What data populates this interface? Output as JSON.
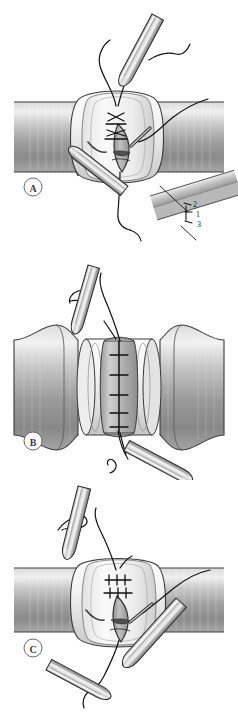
{
  "figure": {
    "background_color": "#ffffff",
    "width": 238,
    "height": 715,
    "panel_count": 3
  },
  "palette": {
    "outline": "#2b2b2b",
    "suture_thread": "#111111",
    "vessel_light": "#f2f2f2",
    "vessel_mid": "#b6b6b6",
    "vessel_dark": "#8a8a8a",
    "vessel_shadow": "#6e6e6e",
    "cuff_light": "#fafafa",
    "cuff_mid": "#d8d8d8",
    "lumen_fill": "#b2b2b2",
    "lumen_dark": "#6f6f6f",
    "instrument_light": "#fdfdfd",
    "instrument_mid": "#c4c4c4",
    "instrument_dark": "#8e8e8e",
    "label_text": "#3a3a3a",
    "inset_text": "#1a1a1a"
  },
  "panels": [
    {
      "id": "a",
      "label": "A",
      "caption_letter": "A",
      "description": "Open anastomosis with posterior corner sutures placed, lumen visible, two instruments and needle with suture thread",
      "label_position": {
        "x": 33,
        "y": 187
      },
      "vessel": {
        "top": 102,
        "bottom": 172,
        "orientation": "horizontal"
      },
      "lumen_state": "open",
      "suture_count": 3,
      "instruments": [
        {
          "name": "needle-holder",
          "position": "upper-right",
          "angle": -62
        },
        {
          "name": "forceps",
          "position": "lower-left",
          "angle": 38
        },
        {
          "name": "needle",
          "position": "center-right",
          "angle": 35
        }
      ],
      "inset": {
        "name": "layer-detail-inset",
        "description": "Magnified cross-section showing suture passing through tissue layers",
        "labels": [
          {
            "text": "2",
            "x": 193,
            "y": 205
          },
          {
            "text": "1",
            "x": 196,
            "y": 215
          },
          {
            "text": "3",
            "x": 197,
            "y": 225
          }
        ]
      }
    },
    {
      "id": "b",
      "label": "B",
      "caption_letter": "B",
      "description": "Completed running anastomosis, closed suture line with five stitches, waisted vessel with cuff collar",
      "label_position": {
        "x": 33,
        "y": 441
      },
      "vessel": {
        "top": 340,
        "bottom": 435,
        "orientation": "horizontal"
      },
      "lumen_state": "closed",
      "suture_count": 5,
      "instruments": [
        {
          "name": "needle-holder",
          "position": "upper-left",
          "angle": -70
        },
        {
          "name": "forceps",
          "position": "lower-right",
          "angle": 25
        }
      ]
    },
    {
      "id": "c",
      "label": "C",
      "caption_letter": "C",
      "description": "Anterior wall closure in progress, partial suture line with lumen still visible, needle entering tissue",
      "label_position": {
        "x": 33,
        "y": 648
      },
      "vessel": {
        "top": 568,
        "bottom": 632,
        "orientation": "horizontal"
      },
      "lumen_state": "partially-closed",
      "suture_count": 2,
      "instruments": [
        {
          "name": "needle-holder",
          "position": "upper-left",
          "angle": -72
        },
        {
          "name": "forceps",
          "position": "lower-left",
          "angle": 28
        },
        {
          "name": "needle",
          "position": "center-right",
          "angle": 42
        }
      ]
    }
  ]
}
